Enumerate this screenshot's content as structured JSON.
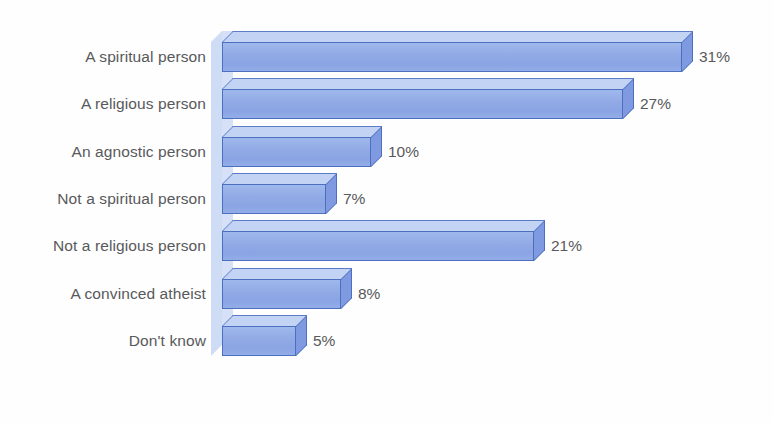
{
  "chart_data": {
    "type": "bar",
    "orientation": "horizontal",
    "title": "",
    "subtitle": "",
    "xlabel": "",
    "ylabel": "",
    "grid": false,
    "legend": false,
    "axis_visible": false,
    "value_suffix": "%",
    "xlim": [
      0,
      31
    ],
    "categories": [
      "A spiritual person",
      "A religious person",
      "An agnostic person",
      "Not a spiritual person",
      "Not a religious person",
      "A convinced atheist",
      "Don't know"
    ],
    "values": [
      31,
      27,
      10,
      7,
      21,
      8,
      5
    ],
    "value_labels": [
      "31%",
      "27%",
      "10%",
      "7%",
      "21%",
      "8%",
      "5%"
    ],
    "colors": {
      "bar_front": "#8faae6",
      "bar_top": "#c3d3f4",
      "bar_side": "#7f9ae0",
      "bar_border": "#4d6fc0",
      "axis_wall": "#d6e1f8",
      "label_text": "#58595b",
      "background": "#ffffff"
    }
  }
}
